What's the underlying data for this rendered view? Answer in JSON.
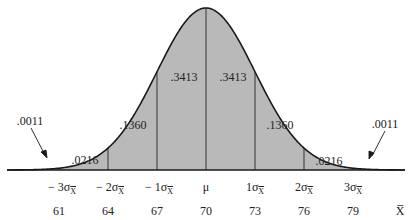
{
  "figure": {
    "title": "",
    "curve_fill": "#b9b9b9",
    "curve_stroke": "#1a1a1a"
  },
  "areas": [
    {
      "id": "left-tail",
      "value": ".0011"
    },
    {
      "id": "m3-m2",
      "value": ".0216"
    },
    {
      "id": "m2-m1",
      "value": ".1360"
    },
    {
      "id": "m1-mu",
      "value": ".3413"
    },
    {
      "id": "mu-p1",
      "value": ".3413"
    },
    {
      "id": "p1-p2",
      "value": ".1360"
    },
    {
      "id": "p2-p3",
      "value": ".0216"
    },
    {
      "id": "right-tail",
      "value": ".0011"
    }
  ],
  "sigma_labels": [
    {
      "prefix": "− 3σ",
      "sub": "X"
    },
    {
      "prefix": "− 2σ",
      "sub": "X"
    },
    {
      "prefix": "− 1σ",
      "sub": "X"
    },
    {
      "prefix": "μ",
      "sub": ""
    },
    {
      "prefix": "1σ",
      "sub": "X"
    },
    {
      "prefix": "2σ",
      "sub": "X"
    },
    {
      "prefix": "3σ",
      "sub": "X"
    }
  ],
  "x_values": [
    "61",
    "64",
    "67",
    "70",
    "73",
    "76",
    "79"
  ],
  "x_axis_label": "X̅",
  "chart_data": {
    "type": "area",
    "xlabel": "X̅",
    "ylabel": "",
    "mean": 70,
    "std_error": 3,
    "tick_positions": [
      61,
      64,
      67,
      70,
      73,
      76,
      79
    ],
    "tick_labels": [
      "−3σX̅",
      "−2σX̅",
      "−1σX̅",
      "μ",
      "1σX̅",
      "2σX̅",
      "3σX̅"
    ],
    "region_probabilities": [
      {
        "range": "< −3σ",
        "p": 0.0011
      },
      {
        "range": "−3σ to −2σ",
        "p": 0.0216
      },
      {
        "range": "−2σ to −1σ",
        "p": 0.136
      },
      {
        "range": "−1σ to μ",
        "p": 0.3413
      },
      {
        "range": "μ to 1σ",
        "p": 0.3413
      },
      {
        "range": "1σ to 2σ",
        "p": 0.136
      },
      {
        "range": "2σ to 3σ",
        "p": 0.0216
      },
      {
        "range": "> 3σ",
        "p": 0.0011
      }
    ],
    "grid": false,
    "legend": "none"
  }
}
